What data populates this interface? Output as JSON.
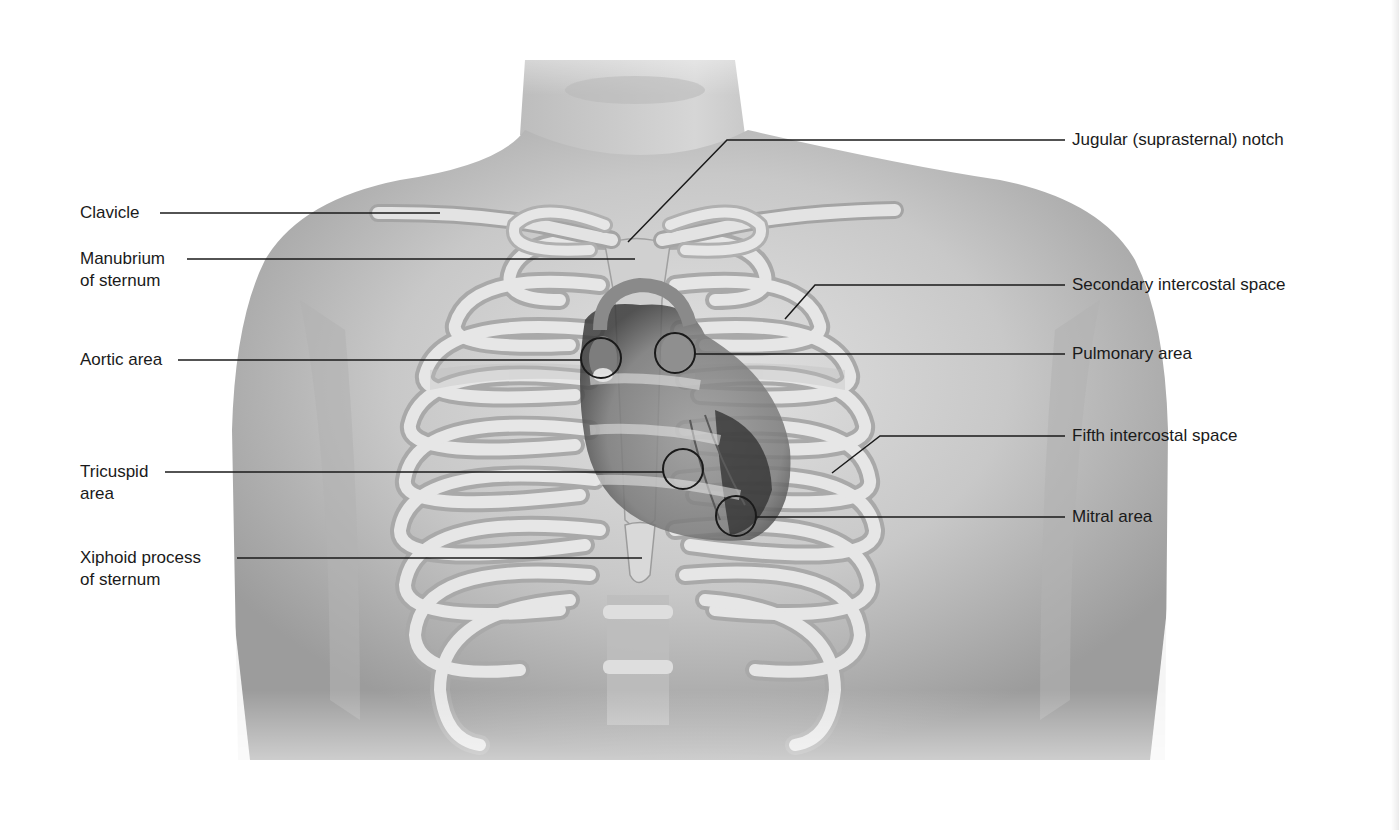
{
  "figure": {
    "colors": {
      "background": "#ffffff",
      "skin": "#c9c9c9",
      "skin_dark": "#9a9a9a",
      "bone": "#e4e4e4",
      "bone_shadow": "#a8a8a8",
      "heart": "#8c8c8c",
      "heart_dark": "#3a3a3a",
      "leader_line": "#1a1a1a",
      "label_text": "#1a1a1a"
    },
    "labels_left": [
      {
        "id": "clavicle",
        "lines": [
          "Clavicle"
        ]
      },
      {
        "id": "manubrium",
        "lines": [
          "Manubrium",
          "of sternum"
        ]
      },
      {
        "id": "aortic-area",
        "lines": [
          "Aortic area"
        ]
      },
      {
        "id": "tricuspid-area",
        "lines": [
          "Tricuspid",
          "area"
        ]
      },
      {
        "id": "xiphoid-process",
        "lines": [
          "Xiphoid process",
          "of sternum"
        ]
      }
    ],
    "labels_right": [
      {
        "id": "jugular-notch",
        "lines": [
          "Jugular (suprasternal) notch"
        ]
      },
      {
        "id": "secondary-intercostal-space",
        "lines": [
          "Secondary intercostal space"
        ]
      },
      {
        "id": "pulmonary-area",
        "lines": [
          "Pulmonary area"
        ]
      },
      {
        "id": "fifth-intercostal-space",
        "lines": [
          "Fifth intercostal space"
        ]
      },
      {
        "id": "mitral-area",
        "lines": [
          "Mitral area"
        ]
      }
    ],
    "auscultation_circles": [
      {
        "id": "aortic",
        "label": "Aortic area"
      },
      {
        "id": "pulmonary",
        "label": "Pulmonary area"
      },
      {
        "id": "tricuspid",
        "label": "Tricuspid area"
      },
      {
        "id": "mitral",
        "label": "Mitral area"
      }
    ]
  }
}
